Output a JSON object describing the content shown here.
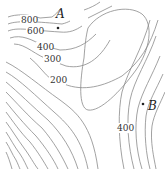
{
  "map": {
    "type": "contour map",
    "contour_labels": [
      {
        "text": "800",
        "x": 29,
        "y": 23
      },
      {
        "text": "600",
        "x": 34,
        "y": 34
      },
      {
        "text": "400",
        "x": 44,
        "y": 50
      },
      {
        "text": "300",
        "x": 51,
        "y": 62
      },
      {
        "text": "200",
        "x": 57,
        "y": 83
      },
      {
        "text": "400",
        "x": 124,
        "y": 131
      }
    ],
    "points": [
      {
        "name": "A",
        "label": "A",
        "dot_x": 58,
        "dot_y": 28,
        "label_x": 57,
        "label_y": 18
      },
      {
        "name": "B",
        "label": "B",
        "dot_x": 143,
        "dot_y": 104,
        "label_x": 149,
        "label_y": 110
      }
    ],
    "line_color": "#8a8a8a"
  }
}
